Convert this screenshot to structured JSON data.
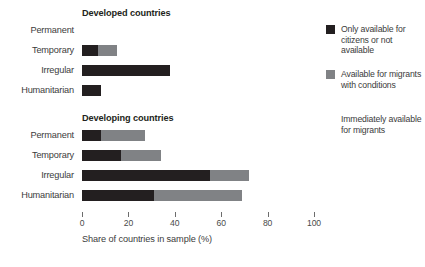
{
  "chart_data": {
    "type": "bar",
    "orientation": "horizontal",
    "stacked": true,
    "title": "",
    "xlabel": "Share of countries in sample (%)",
    "ylabel": "",
    "xlim": [
      0,
      100
    ],
    "xticks": [
      0,
      20,
      40,
      60,
      80,
      100
    ],
    "xtick_labels": [
      "0",
      "20",
      "40",
      "60",
      "80",
      "100"
    ],
    "grid": false,
    "legend_position": "right",
    "categories": [
      "Permanent",
      "Temporary",
      "Irregular",
      "Humanitarian"
    ],
    "series": [
      {
        "name": "Only available for citizens or not available",
        "color": "#231f20",
        "values_by_panel": {
          "Developed countries": [
            0,
            7,
            38,
            8
          ],
          "Developing countries": [
            8,
            17,
            55,
            31
          ]
        }
      },
      {
        "name": "Available for migrants with conditions",
        "color": "#808285",
        "values_by_panel": {
          "Developed countries": [
            0,
            8,
            0,
            0
          ],
          "Developing countries": [
            19,
            17,
            17,
            38
          ]
        }
      },
      {
        "name": "Immediately available for migrants",
        "color": "#ffffff",
        "values_by_panel": {
          "Developed countries": [
            100,
            85,
            62,
            92
          ],
          "Developing countries": [
            73,
            66,
            28,
            31
          ]
        }
      }
    ],
    "panels": [
      {
        "title": "Developed countries",
        "rows": [
          {
            "label": "Permanent",
            "dark": 0,
            "gray": 0,
            "dark_end": 0,
            "gray_end": 0
          },
          {
            "label": "Temporary",
            "dark": 7,
            "gray": 8,
            "dark_end": 7,
            "gray_end": 15
          },
          {
            "label": "Irregular",
            "dark": 38,
            "gray": 0,
            "dark_end": 38,
            "gray_end": 38
          },
          {
            "label": "Humanitarian",
            "dark": 8,
            "gray": 0,
            "dark_end": 8,
            "gray_end": 8
          }
        ]
      },
      {
        "title": "Developing countries",
        "rows": [
          {
            "label": "Permanent",
            "dark": 8,
            "gray": 19,
            "dark_end": 8,
            "gray_end": 27
          },
          {
            "label": "Temporary",
            "dark": 17,
            "gray": 17,
            "dark_end": 17,
            "gray_end": 34
          },
          {
            "label": "Irregular",
            "dark": 55,
            "gray": 17,
            "dark_end": 55,
            "gray_end": 72
          },
          {
            "label": "Humanitarian",
            "dark": 31,
            "gray": 38,
            "dark_end": 31,
            "gray_end": 69
          }
        ]
      }
    ]
  },
  "legend": {
    "items": [
      {
        "label": "Only available for citizens or not available",
        "color": "#231f20",
        "swatch_visible": true
      },
      {
        "label": "Available for migrants with conditions",
        "color": "#808285",
        "swatch_visible": true
      },
      {
        "label": "Immediately available for migrants",
        "color": "#ffffff",
        "swatch_visible": false
      }
    ]
  },
  "colors": {
    "dark": "#231f20",
    "gray": "#808285",
    "light": "#ffffff",
    "text": "#3b3b3b",
    "axis": "#6d6d6d",
    "background": "#ffffff"
  }
}
